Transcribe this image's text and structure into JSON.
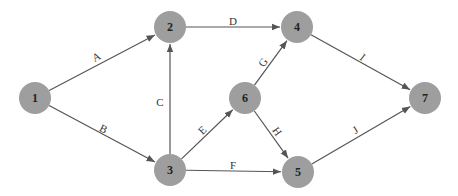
{
  "diagram": {
    "type": "activity-on-arrow network",
    "nodes": [
      {
        "id": "1",
        "label": "1",
        "x": 35,
        "y": 98
      },
      {
        "id": "2",
        "label": "2",
        "x": 170,
        "y": 27
      },
      {
        "id": "3",
        "label": "3",
        "x": 170,
        "y": 170
      },
      {
        "id": "4",
        "label": "4",
        "x": 297,
        "y": 27
      },
      {
        "id": "5",
        "label": "5",
        "x": 298,
        "y": 172
      },
      {
        "id": "6",
        "label": "6",
        "x": 245,
        "y": 98
      },
      {
        "id": "7",
        "label": "7",
        "x": 425,
        "y": 98
      }
    ],
    "edges": [
      {
        "label": "A",
        "from": "1",
        "to": "2",
        "lx": 97,
        "ly": 58,
        "rot": -27
      },
      {
        "label": "B",
        "from": "1",
        "to": "3",
        "lx": 103,
        "ly": 130,
        "rot": 27
      },
      {
        "label": "C",
        "from": "3",
        "to": "2",
        "lx": 160,
        "ly": 103,
        "rot": 0
      },
      {
        "label": "D",
        "from": "2",
        "to": "4",
        "lx": 233,
        "ly": 22,
        "rot": 0
      },
      {
        "label": "E",
        "from": "3",
        "to": "6",
        "lx": 203,
        "ly": 131,
        "rot": -45
      },
      {
        "label": "F",
        "from": "3",
        "to": "5",
        "lx": 233,
        "ly": 166,
        "rot": 0
      },
      {
        "label": "G",
        "from": "6",
        "to": "4",
        "lx": 264,
        "ly": 63,
        "rot": -55
      },
      {
        "label": "H",
        "from": "6",
        "to": "5",
        "lx": 276,
        "ly": 132,
        "rot": 55
      },
      {
        "label": "I",
        "from": "4",
        "to": "7",
        "lx": 362,
        "ly": 58,
        "rot": 37
      },
      {
        "label": "J",
        "from": "5",
        "to": "7",
        "lx": 356,
        "ly": 131,
        "rot": -32
      }
    ],
    "colors": {
      "node_fill": "#9e9e9e",
      "edge": "#555555",
      "text": "#222222"
    }
  }
}
